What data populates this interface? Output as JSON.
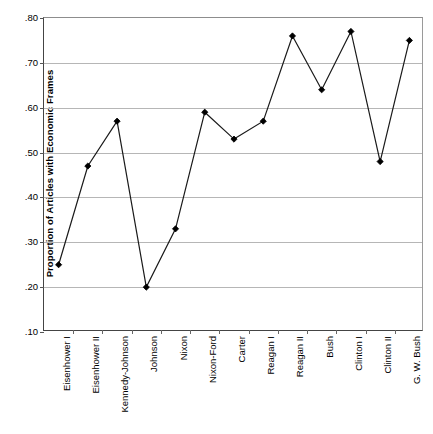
{
  "chart_data": {
    "type": "line",
    "title": "",
    "xlabel": "",
    "ylabel": "Proportion of Articles with Economic Frames",
    "ylim": [
      0.1,
      0.8
    ],
    "ytick_labels": [
      ".80",
      ".70",
      ".60",
      ".50",
      ".40",
      ".30",
      ".20",
      ".10"
    ],
    "ytick_values": [
      0.8,
      0.7,
      0.6,
      0.5,
      0.4,
      0.3,
      0.2,
      0.1
    ],
    "grid": true,
    "legend": "none",
    "marker": "filled-diamond",
    "categories": [
      "Eisenhower I",
      "Eisenhower II",
      "Kennedy-Johnson",
      "Johnson",
      "Nixon",
      "Nixon-Ford",
      "Carter",
      "Reagan I",
      "Reagan II",
      "Bush",
      "Clinton I",
      "Clinton II",
      "G. W. Bush"
    ],
    "values": [
      0.25,
      0.47,
      0.57,
      0.2,
      0.33,
      0.59,
      0.53,
      0.57,
      0.76,
      0.64,
      0.77,
      0.48,
      0.75
    ]
  }
}
